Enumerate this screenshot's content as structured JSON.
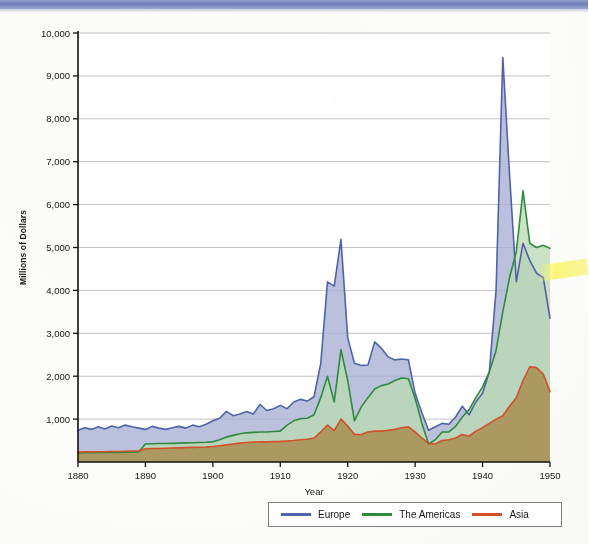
{
  "page": {
    "banner_color": "#6d80b8",
    "background_color": "#fbfbf9"
  },
  "chart_data": {
    "type": "area",
    "title": "",
    "subtitle": "",
    "xlabel": "Year",
    "ylabel": "Millions of Dollars",
    "xlim": [
      1880,
      1950
    ],
    "ylim": [
      0,
      10000
    ],
    "xticks": [
      1880,
      1890,
      1900,
      1910,
      1920,
      1930,
      1940,
      1950
    ],
    "xtick_labels": [
      "1880",
      "1890",
      "1900",
      "1910",
      "1920",
      "1930",
      "1940",
      "1950"
    ],
    "yticks": [
      1000,
      2000,
      3000,
      4000,
      5000,
      6000,
      7000,
      8000,
      9000,
      10000
    ],
    "ytick_labels": [
      "1,000",
      "2,000",
      "3,000",
      "4,000",
      "5,000",
      "6,000",
      "7,000",
      "8,000",
      "9,000",
      "10,000"
    ],
    "grid": true,
    "grid_color": "#9a9a9a",
    "legend_position": "bottom",
    "stacked": false,
    "annotation": "yellow-highlighter-mark",
    "x": [
      1880,
      1881,
      1882,
      1883,
      1884,
      1885,
      1886,
      1887,
      1888,
      1889,
      1890,
      1891,
      1892,
      1893,
      1894,
      1895,
      1896,
      1897,
      1898,
      1899,
      1900,
      1901,
      1902,
      1903,
      1904,
      1905,
      1906,
      1907,
      1908,
      1909,
      1910,
      1911,
      1912,
      1913,
      1914,
      1915,
      1916,
      1917,
      1918,
      1919,
      1920,
      1921,
      1922,
      1923,
      1924,
      1925,
      1926,
      1927,
      1928,
      1929,
      1930,
      1931,
      1932,
      1933,
      1934,
      1935,
      1936,
      1937,
      1938,
      1939,
      1940,
      1941,
      1942,
      1943,
      1944,
      1945,
      1946,
      1947,
      1948,
      1949,
      1950
    ],
    "series": [
      {
        "name": "Europe",
        "color": "#4f63a8",
        "fill": "#a8aed2",
        "values": [
          740,
          800,
          760,
          820,
          770,
          840,
          800,
          860,
          820,
          790,
          760,
          830,
          790,
          760,
          800,
          830,
          790,
          860,
          820,
          880,
          960,
          1020,
          1180,
          1080,
          1120,
          1180,
          1120,
          1340,
          1200,
          1240,
          1320,
          1240,
          1400,
          1460,
          1420,
          1520,
          2300,
          4200,
          4100,
          5190,
          2900,
          2300,
          2250,
          2260,
          2800,
          2650,
          2450,
          2380,
          2400,
          2380,
          1600,
          1150,
          740,
          820,
          900,
          880,
          1050,
          1300,
          1100,
          1400,
          1600,
          2100,
          4000,
          9430,
          6700,
          4200,
          5100,
          4700,
          4400,
          4300,
          3350
        ]
      },
      {
        "name": "The Americas",
        "color": "#2e8b3e",
        "fill": "#bcd9b5",
        "values": [
          210,
          215,
          215,
          220,
          220,
          225,
          225,
          230,
          230,
          235,
          420,
          425,
          430,
          430,
          435,
          440,
          445,
          450,
          455,
          460,
          470,
          520,
          580,
          620,
          660,
          680,
          690,
          700,
          700,
          710,
          720,
          860,
          960,
          1010,
          1020,
          1100,
          1500,
          2000,
          1400,
          2620,
          1900,
          960,
          1280,
          1500,
          1700,
          1780,
          1820,
          1900,
          1960,
          1940,
          1480,
          900,
          420,
          520,
          700,
          700,
          830,
          1050,
          1220,
          1500,
          1750,
          2100,
          2600,
          3500,
          4300,
          4900,
          6320,
          5100,
          5000,
          5050,
          4980
        ]
      },
      {
        "name": "Asia",
        "color": "#d1502a",
        "fill": "#a99459",
        "values": [
          230,
          235,
          235,
          240,
          240,
          245,
          245,
          250,
          255,
          255,
          310,
          315,
          315,
          320,
          325,
          330,
          335,
          340,
          345,
          350,
          360,
          380,
          400,
          420,
          440,
          455,
          465,
          470,
          470,
          475,
          480,
          490,
          500,
          520,
          530,
          560,
          700,
          860,
          730,
          1000,
          840,
          640,
          640,
          700,
          720,
          720,
          740,
          760,
          800,
          820,
          700,
          560,
          430,
          420,
          500,
          520,
          560,
          640,
          600,
          720,
          800,
          900,
          1000,
          1080,
          1300,
          1500,
          1900,
          2220,
          2200,
          2050,
          1640
        ]
      }
    ]
  },
  "legend": {
    "items": [
      {
        "label": "Europe",
        "color": "#4f63a8"
      },
      {
        "label": "The Americas",
        "color": "#2e8b3e"
      },
      {
        "label": "Asia",
        "color": "#d1502a"
      }
    ]
  }
}
